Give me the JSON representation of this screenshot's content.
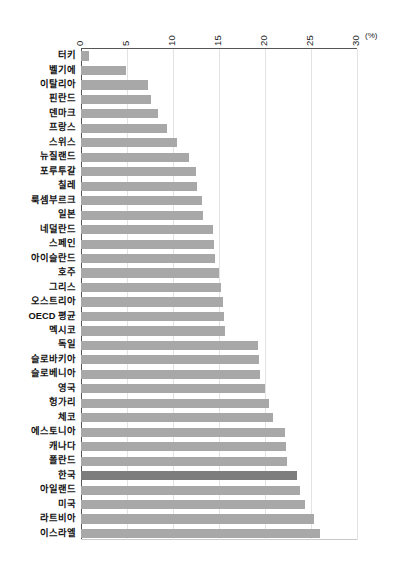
{
  "chart_data": {
    "type": "bar",
    "orientation": "horizontal",
    "title": "",
    "subtitle": "",
    "xlabel": "",
    "ylabel": "",
    "unit_label": "(%)",
    "xlim": [
      0,
      30
    ],
    "xticks": [
      0,
      5,
      10,
      15,
      20,
      25,
      30
    ],
    "xtick_labels": [
      "0",
      "5",
      "10",
      "15",
      "20",
      "25",
      "30"
    ],
    "grid": "vertical",
    "legend": "none",
    "highlight_category": "한국",
    "colors": {
      "bar": "#a8a8a8",
      "bar_highlight": "#7d7d7d",
      "gridline": "#e3e3e3",
      "axis": "#565656",
      "text": "#111111",
      "background": "#ffffff"
    },
    "categories": [
      "터키",
      "벨기에",
      "이탈리아",
      "핀란드",
      "덴마크",
      "프랑스",
      "스위스",
      "뉴질랜드",
      "포루투갈",
      "칠레",
      "룩셈부르크",
      "일본",
      "네덜란드",
      "스페인",
      "아이슬란드",
      "호주",
      "그리스",
      "오스트리아",
      "OECD 평균",
      "멕시코",
      "독일",
      "슬로바키아",
      "슬로베니아",
      "영국",
      "헝가리",
      "체코",
      "에스토니아",
      "캐나다",
      "폴란드",
      "한국",
      "아일랜드",
      "미국",
      "라트비아",
      "이스라엘"
    ],
    "values": [
      0.9,
      4.9,
      7.3,
      7.6,
      8.4,
      9.3,
      10.4,
      11.7,
      12.5,
      12.6,
      13.1,
      13.3,
      14.3,
      14.5,
      14.6,
      15.0,
      15.2,
      15.4,
      15.5,
      15.6,
      19.2,
      19.4,
      19.5,
      20.0,
      20.4,
      20.9,
      22.2,
      22.3,
      22.4,
      23.5,
      23.8,
      24.4,
      25.3,
      26.0
    ]
  }
}
